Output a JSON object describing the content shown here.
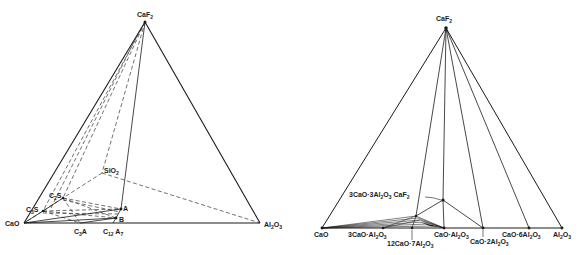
{
  "left_diagram": {
    "title": "CaO-Al2O3-SiO2-CaF2 tetrahedron",
    "vertices": {
      "caf2": {
        "label": "CaF",
        "sub": "2"
      },
      "cao": {
        "label": "CaO"
      },
      "al2o3": {
        "label": "Al",
        "sub1": "2",
        "mid": "O",
        "sub2": "3"
      },
      "sio2": {
        "label": "SiO",
        "sub": "2"
      }
    },
    "points": {
      "c2s": {
        "label": "C",
        "sub": "2",
        "tail": "S"
      },
      "c3s": {
        "label": "C",
        "sub": "3",
        "tail": "S"
      },
      "a": {
        "label": "A"
      },
      "b": {
        "label": "B"
      },
      "c3a": {
        "label": "C",
        "sub": "3",
        "tail": "A"
      },
      "c12a7": {
        "label": "C",
        "sub": "12",
        "tail": " A",
        "sub2": "7"
      }
    }
  },
  "right_diagram": {
    "title": "CaO-Al2O3-CaF2 ternary",
    "vertices": {
      "caf2": {
        "label": "CaF",
        "sub": "2"
      },
      "cao": {
        "label": "CaO"
      },
      "al2o3": {
        "label": "Al",
        "sub1": "2",
        "mid": "O",
        "sub2": "3"
      }
    },
    "compounds": {
      "c3a": {
        "a": "3CaO·Al",
        "s1": "2",
        "b": "O",
        "s2": "3"
      },
      "c12a7": {
        "a": "12CaO·7Al",
        "s1": "2",
        "b": "O",
        "s2": "3"
      },
      "ca": {
        "a": "CaO·Al",
        "s1": "2",
        "b": "O",
        "s2": "3"
      },
      "ca2": {
        "a": "CaO·2Al",
        "s1": "2",
        "b": "O",
        "s2": "3"
      },
      "ca6": {
        "a": "CaO·6Al",
        "s1": "2",
        "b": "O",
        "s2": "3"
      },
      "c3a3f": {
        "a": "3CaO·3Al",
        "s1": "2",
        "b": "O",
        "s2": "3",
        "c": " CaF",
        "s3": "2"
      }
    }
  }
}
